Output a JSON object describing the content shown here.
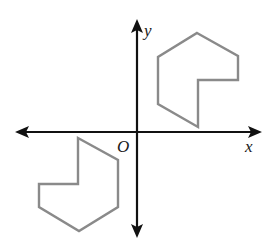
{
  "diagram": {
    "type": "coordinate-plane",
    "axes": {
      "x_label": "x",
      "y_label": "y",
      "origin_label": "O",
      "color": "#111111"
    },
    "shapes": [
      {
        "name": "upper-right-polygon",
        "quadrant": "I",
        "color": "#8a8a8a",
        "points": "197,33 238,56 238,80 198,80 198,127 158,104 158,57"
      },
      {
        "name": "lower-left-polygon",
        "quadrant": "III",
        "color": "#8a8a8a",
        "points": "78,138 118,160 118,207 79,231 39,207 39,184 78,184"
      }
    ]
  }
}
